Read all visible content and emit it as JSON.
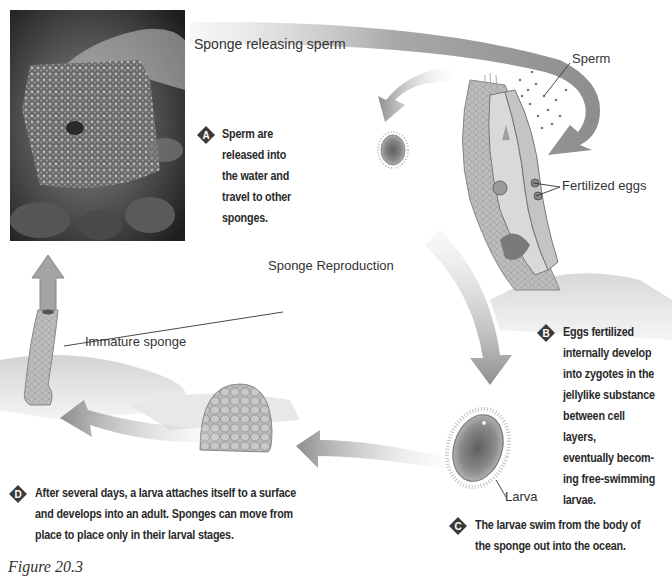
{
  "figure": {
    "title": "Sponge Reproduction",
    "caption": "Figure 20.3",
    "photo": {
      "label": "Sponge releasing sperm",
      "alt": "Barrel sponge photo releasing cloud of sperm"
    }
  },
  "labels": {
    "sperm": "Sperm",
    "fertilized_eggs": "Fertilized eggs",
    "immature_sponge": "Immature sponge",
    "larva": "Larva"
  },
  "steps": [
    {
      "letter": "A",
      "lines": [
        "Sperm are",
        "released into",
        "the water and",
        "travel to other",
        "sponges."
      ]
    },
    {
      "letter": "B",
      "lines": [
        "Eggs fertilized",
        "internally develop",
        "into zygotes in the",
        "jellylike substance",
        "between cell layers,",
        "eventually becom-",
        "ing free-swimming",
        "larvae."
      ]
    },
    {
      "letter": "C",
      "lines": [
        "The larvae swim from the body of",
        "the sponge out into the ocean."
      ]
    },
    {
      "letter": "D",
      "lines": [
        "After several days, a larva attaches itself to a surface",
        "and develops into an adult. Sponges can move from",
        "place to place only in their larval stages."
      ]
    }
  ],
  "colors": {
    "arrow": "#9a9a9a",
    "badge": "#3a3a3a",
    "text": "#2a2a2a"
  }
}
